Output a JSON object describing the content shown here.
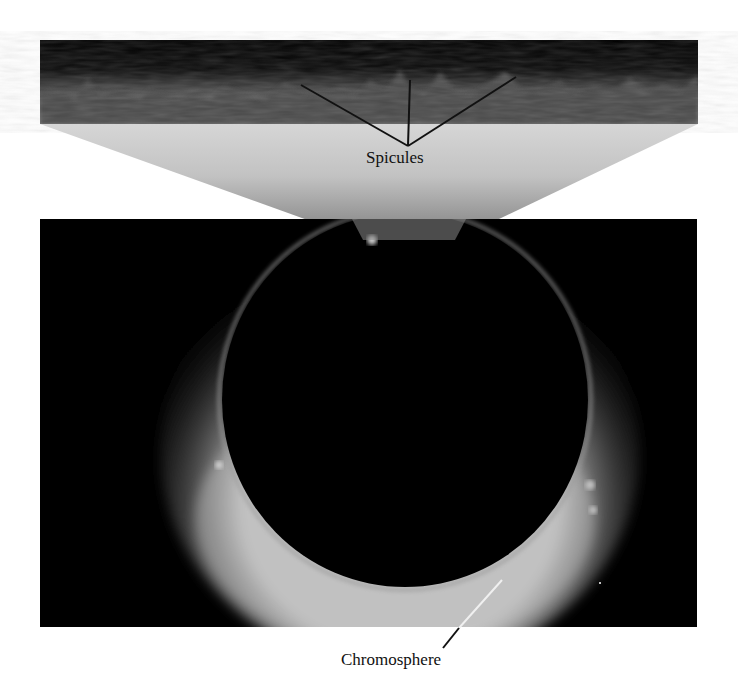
{
  "figure": {
    "inset": {
      "label": "Spicules",
      "pointer_count": 3
    },
    "eclipse_panel": {
      "label": "Chromosphere",
      "pointer_count": 1
    },
    "colors": {
      "background": "#ffffff",
      "sky": "#000000",
      "fan_top": "#d9d9d9",
      "fan_bottom": "#8c8c8c",
      "leader_line_dark": "#111111",
      "leader_line_light": "#f0f0f0",
      "label_text": "#111111"
    }
  }
}
